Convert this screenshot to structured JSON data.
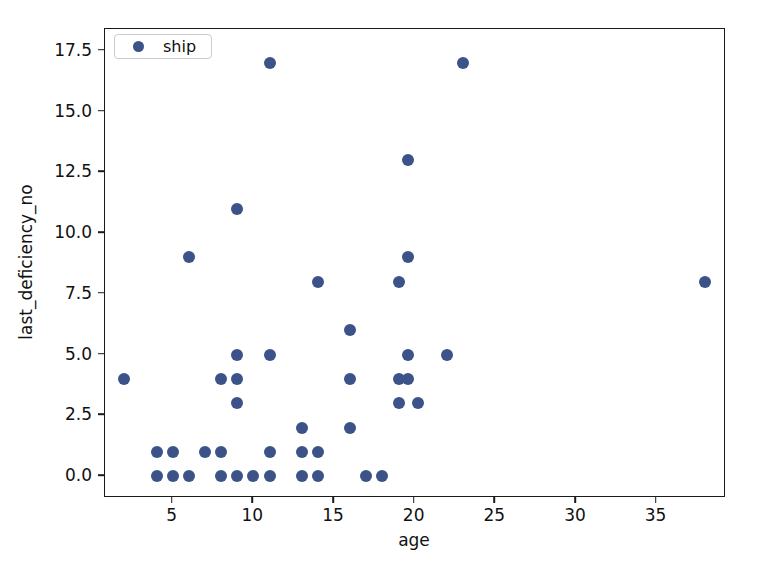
{
  "chart_data": {
    "type": "scatter",
    "title": "",
    "xlabel": "age",
    "ylabel": "last_deficiency_no",
    "xlim": [
      0.8,
      39.3
    ],
    "ylim": [
      -0.9,
      18.4
    ],
    "xticks": [
      5,
      10,
      15,
      20,
      25,
      30,
      35
    ],
    "xticklabels": [
      "5",
      "10",
      "15",
      "20",
      "25",
      "30",
      "35"
    ],
    "yticks": [
      0.0,
      2.5,
      5.0,
      7.5,
      10.0,
      12.5,
      15.0,
      17.5
    ],
    "yticklabels": [
      "0.0",
      "2.5",
      "5.0",
      "7.5",
      "10.0",
      "12.5",
      "15.0",
      "17.5"
    ],
    "grid": false,
    "legend": {
      "position": "upper left",
      "entries": [
        {
          "label": "ship",
          "color": "#3c5389",
          "marker": "circle"
        }
      ]
    },
    "series": [
      {
        "name": "ship",
        "color": "#3c5389",
        "marker": "circle",
        "points": [
          {
            "x": 2,
            "y": 4
          },
          {
            "x": 4,
            "y": 1
          },
          {
            "x": 4,
            "y": 0
          },
          {
            "x": 5,
            "y": 1
          },
          {
            "x": 5,
            "y": 0
          },
          {
            "x": 6,
            "y": 9
          },
          {
            "x": 6,
            "y": 0
          },
          {
            "x": 7,
            "y": 1
          },
          {
            "x": 8,
            "y": 4
          },
          {
            "x": 8,
            "y": 1
          },
          {
            "x": 8,
            "y": 0
          },
          {
            "x": 9,
            "y": 11
          },
          {
            "x": 9,
            "y": 5
          },
          {
            "x": 9,
            "y": 4
          },
          {
            "x": 9,
            "y": 3
          },
          {
            "x": 9,
            "y": 0
          },
          {
            "x": 10,
            "y": 0
          },
          {
            "x": 11,
            "y": 17
          },
          {
            "x": 11,
            "y": 5
          },
          {
            "x": 11,
            "y": 1
          },
          {
            "x": 11,
            "y": 0
          },
          {
            "x": 13,
            "y": 2
          },
          {
            "x": 13,
            "y": 1
          },
          {
            "x": 13,
            "y": 0
          },
          {
            "x": 14,
            "y": 8
          },
          {
            "x": 14,
            "y": 1
          },
          {
            "x": 14,
            "y": 0
          },
          {
            "x": 16,
            "y": 6
          },
          {
            "x": 16,
            "y": 4
          },
          {
            "x": 16,
            "y": 2
          },
          {
            "x": 17,
            "y": 0
          },
          {
            "x": 18,
            "y": 0
          },
          {
            "x": 19,
            "y": 8
          },
          {
            "x": 19,
            "y": 4
          },
          {
            "x": 19,
            "y": 3
          },
          {
            "x": 19.6,
            "y": 13
          },
          {
            "x": 19.6,
            "y": 9
          },
          {
            "x": 19.6,
            "y": 5
          },
          {
            "x": 19.6,
            "y": 4
          },
          {
            "x": 20.2,
            "y": 3
          },
          {
            "x": 22,
            "y": 5
          },
          {
            "x": 23,
            "y": 17
          },
          {
            "x": 38,
            "y": 8
          }
        ]
      }
    ]
  }
}
